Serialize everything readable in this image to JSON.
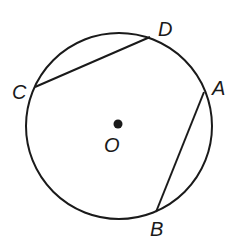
{
  "diagram": {
    "type": "geometry-circle-chords",
    "canvas": {
      "width": 237,
      "height": 241
    },
    "stroke_color": "#1a1a1a",
    "background": "#ffffff",
    "circle": {
      "cx": 119,
      "cy": 126,
      "r": 93,
      "center_label": "O"
    },
    "center_point": {
      "x": 118,
      "y": 124,
      "r": 4.5
    },
    "points": {
      "A": {
        "x": 204,
        "y": 92
      },
      "B": {
        "x": 156,
        "y": 212
      },
      "C": {
        "x": 35,
        "y": 87
      },
      "D": {
        "x": 150,
        "y": 37
      }
    },
    "chords": [
      {
        "from": "C",
        "to": "D"
      },
      {
        "from": "A",
        "to": "B"
      }
    ],
    "labels": [
      {
        "text": "D",
        "x": 158,
        "y": 36
      },
      {
        "text": "C",
        "x": 12,
        "y": 99
      },
      {
        "text": "A",
        "x": 212,
        "y": 95
      },
      {
        "text": "O",
        "x": 104,
        "y": 152
      },
      {
        "text": "B",
        "x": 150,
        "y": 236
      }
    ]
  }
}
